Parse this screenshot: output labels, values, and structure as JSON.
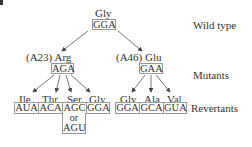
{
  "diagram": {
    "row_labels": {
      "wild_type": "Wild type",
      "mutants": "Mutants",
      "revertants": "Revertants"
    },
    "wild_type": {
      "amino_acid": "Gly",
      "codon": "GGA"
    },
    "mutants": [
      {
        "position": "(A23)",
        "amino_acid": "Arg",
        "codon": "AGA"
      },
      {
        "position": "(A46)",
        "amino_acid": "Glu",
        "codon": "GAA"
      }
    ],
    "revertants_from_A23": [
      {
        "amino_acid": "Ile",
        "codon": "AUA"
      },
      {
        "amino_acid": "Thr",
        "codon": "ACA"
      },
      {
        "amino_acid": "Ser",
        "codon": "AGC",
        "or_label": "or",
        "alt_codon": "AGU"
      },
      {
        "amino_acid": "Gly",
        "codon": "GGA"
      }
    ],
    "revertants_from_A46": [
      {
        "amino_acid": "Gly",
        "codon": "GGA"
      },
      {
        "amino_acid": "Ala",
        "codon": "GCA"
      },
      {
        "amino_acid": "Val",
        "codon": "GUA"
      }
    ],
    "colors": {
      "text": "#333333",
      "box_border": "#999999",
      "arrow": "#444444"
    }
  }
}
